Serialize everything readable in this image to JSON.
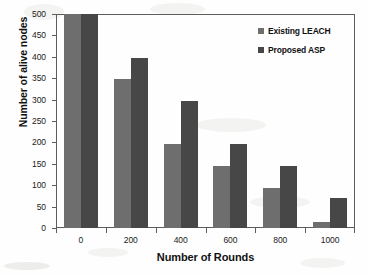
{
  "chart_data": {
    "type": "bar",
    "title": "",
    "xlabel": "Number of Rounds",
    "ylabel": "Number of  alive nodes",
    "categories": [
      "0",
      "200",
      "400",
      "600",
      "800",
      "1000"
    ],
    "series": [
      {
        "name": "Existing LEACH",
        "color": "#6e6e6e",
        "values": [
          500,
          347,
          197,
          145,
          94,
          13
        ]
      },
      {
        "name": "Proposed ASP",
        "color": "#474747",
        "values": [
          500,
          397,
          296,
          196,
          144,
          71
        ]
      }
    ],
    "ylim": [
      0,
      500
    ],
    "ytick_labels": [
      "0",
      "50",
      "100",
      "150",
      "200",
      "250",
      "300",
      "350",
      "400",
      "450",
      "500"
    ],
    "ytick_values": [
      0,
      50,
      100,
      150,
      200,
      250,
      300,
      350,
      400,
      450,
      500
    ],
    "xtick_labels": [
      "0",
      "200",
      "400",
      "600",
      "800",
      "1000"
    ],
    "grid": false,
    "legend_position": "top-right"
  },
  "legend": {
    "entries": [
      {
        "label": "Existing LEACH"
      },
      {
        "label": "Proposed ASP"
      }
    ]
  }
}
